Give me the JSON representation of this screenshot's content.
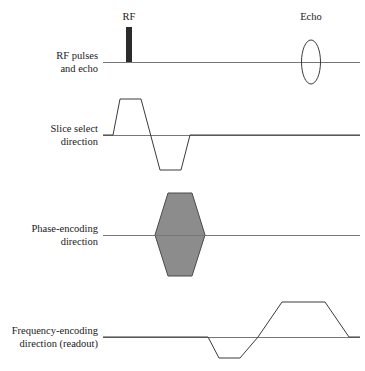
{
  "figure": {
    "background_color": "#ffffff",
    "line_color": "#3a3a3a",
    "baseline_color": "#777777",
    "fill_gray": "#8c8c8c",
    "rf_pulse_color": "#2b2b2b"
  },
  "event_labels": {
    "rf": "RF",
    "echo": "Echo"
  },
  "rows": [
    {
      "id": "rf-pulses-and-echo",
      "label_line1": "RF pulses",
      "label_line2": "and echo",
      "baseline_y": 62
    },
    {
      "id": "slice-select-direction",
      "label_line1": "Slice select",
      "label_line2": "direction",
      "baseline_y": 135
    },
    {
      "id": "phase-encoding-direction",
      "label_line1": "Phase-encoding",
      "label_line2": "direction",
      "baseline_y": 235
    },
    {
      "id": "frequency-encoding-direction",
      "label_line1": "Frequency-encoding",
      "label_line2": "direction (readout)",
      "baseline_y": 337
    }
  ],
  "chart_data": {
    "type": "line",
    "xlabel": "",
    "ylabel": "",
    "grid": false,
    "legend": "none",
    "axis_x_start": 103,
    "axis_x_end": 360,
    "label_right_edge": 98,
    "series": [
      {
        "name": "RF pulses and echo",
        "baseline_y": 62,
        "elements": [
          {
            "kind": "rect",
            "name": "rf-pulse",
            "x": 126,
            "y": 27,
            "width": 6,
            "height": 35,
            "fill": "#2b2b2b"
          },
          {
            "kind": "ellipse",
            "name": "echo-signal",
            "cx": 311,
            "cy": 62,
            "rx": 9.5,
            "ry": 22
          }
        ]
      },
      {
        "name": "Slice select direction",
        "baseline_y": 135,
        "elements": [
          {
            "kind": "polyline",
            "name": "slice-select-gradient",
            "points": "103,135 113,135 120,99 141,99 160,170 181,170 190,135 360,135"
          }
        ]
      },
      {
        "name": "Phase-encoding direction",
        "baseline_y": 235,
        "elements": [
          {
            "kind": "polygon-filled",
            "name": "phase-encoding-gradient",
            "points": "155,235 168,193 192,193 205,235 192,276 168,276",
            "fill": "#8c8c8c"
          }
        ]
      },
      {
        "name": "Frequency-encoding direction (readout)",
        "baseline_y": 337,
        "elements": [
          {
            "kind": "polyline",
            "name": "readout-gradient",
            "points": "103,337 208,337 219,358 240,358 258,337 282,302 325,302 349,337 360,337"
          }
        ]
      }
    ]
  }
}
